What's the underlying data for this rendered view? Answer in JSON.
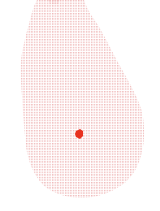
{
  "map": {
    "region": "Sri Lanka",
    "style": "dotted",
    "land_color": "#f2c4c4",
    "background_color": "#ffffff",
    "marker": {
      "icon": "location-dot-icon",
      "color": "#e8311f",
      "x": 79,
      "y": 134
    }
  }
}
